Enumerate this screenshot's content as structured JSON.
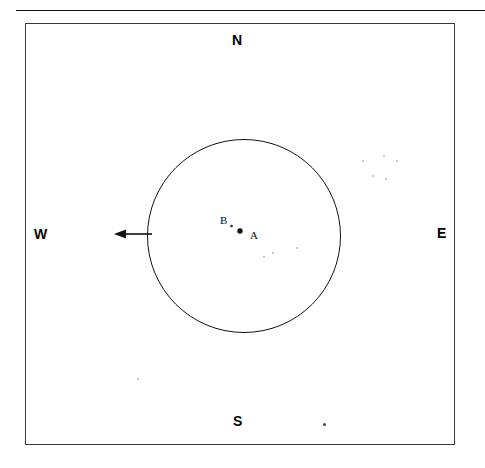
{
  "figure": {
    "type": "schematic-map",
    "background_color": "#ffffff",
    "ink_color": "#111111",
    "top_rule": {
      "present": true,
      "x": 16,
      "y": 10,
      "width": 469
    },
    "frame": {
      "x": 25,
      "y": 23,
      "width": 430,
      "height": 422,
      "border_color": "#3a3a3a"
    }
  },
  "compass": {
    "north": "N",
    "south": "S",
    "west": "W",
    "east": "E"
  },
  "circle": {
    "name": "range-circle",
    "center_x": 244,
    "center_y": 236,
    "radius": 96,
    "stroke_color": "#111111"
  },
  "points": [
    {
      "id": "A",
      "label": "A",
      "marker_x": 240,
      "marker_y": 231,
      "marker_radius": 2.6,
      "label_x": 250,
      "label_y": 230,
      "filled": true
    },
    {
      "id": "B",
      "label": "B",
      "marker_x": 231,
      "marker_y": 226,
      "marker_radius": 1.2,
      "label_x": 220,
      "label_y": 215,
      "filled": true
    }
  ],
  "arrow": {
    "name": "west-arrow",
    "direction": "west",
    "tail_x": 152,
    "tail_y": 234,
    "head_x": 114,
    "head_y": 234,
    "stroke_color": "#111111"
  },
  "specks": [
    {
      "x": 362,
      "y": 160,
      "size": 2,
      "shade": "faint"
    },
    {
      "x": 383,
      "y": 155,
      "size": 2,
      "shade": "faint"
    },
    {
      "x": 396,
      "y": 160,
      "size": 2,
      "shade": "faint"
    },
    {
      "x": 372,
      "y": 175,
      "size": 2,
      "shade": "faint"
    },
    {
      "x": 385,
      "y": 178,
      "size": 2,
      "shade": "faint"
    },
    {
      "x": 263,
      "y": 256,
      "size": 2,
      "shade": "faint"
    },
    {
      "x": 272,
      "y": 252,
      "size": 2,
      "shade": "faint"
    },
    {
      "x": 296,
      "y": 247,
      "size": 2,
      "shade": "faint"
    },
    {
      "x": 137,
      "y": 378,
      "size": 2,
      "shade": "faint"
    },
    {
      "x": 323,
      "y": 423,
      "size": 3,
      "shade": "dark"
    }
  ]
}
